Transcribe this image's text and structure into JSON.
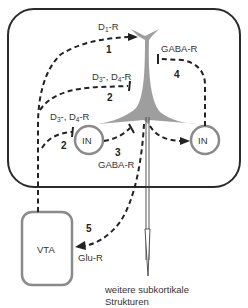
{
  "diagram": {
    "type": "neural-circuit",
    "regions": {
      "cortex_box": {
        "label": ""
      },
      "vta": {
        "label": "VTA"
      },
      "interneuron_left": {
        "label": "IN"
      },
      "interneuron_right": {
        "label": "IN"
      }
    },
    "pathways": [
      {
        "id": "1",
        "number": "1",
        "receptor": "D1-R",
        "receptor_main": "D",
        "receptor_sub": "1",
        "receptor_suffix": "-R",
        "type": "excitatory-arrow"
      },
      {
        "id": "2a",
        "number": "2",
        "receptor": "D3-, D4-R",
        "type": "inhibitory"
      },
      {
        "id": "2b",
        "number": "2",
        "receptor": "D3-, D4-R",
        "type": "inhibitory"
      },
      {
        "id": "3",
        "number": "3",
        "receptor": "GABA-R",
        "type": "inhibitory"
      },
      {
        "id": "4",
        "number": "4",
        "receptor": "GABA-R",
        "type": "inhibitory"
      },
      {
        "id": "5",
        "number": "5",
        "receptor": "Glu-R",
        "type": "excitatory-arrow"
      }
    ],
    "labels": {
      "d1": "D",
      "d1_sub": "1",
      "d1_suffix": "-R",
      "d3": "D",
      "d3_sub": "3",
      "d3_mid": "-, D",
      "d4_sub": "4",
      "d4_suffix": "-R",
      "gaba_r": "GABA-R",
      "glu_r": "Glu-R",
      "num1": "1",
      "num2": "2",
      "num3": "3",
      "num4": "4",
      "num5": "5",
      "output_line1": "weitere subkortikale",
      "output_line2": "Strukturen"
    },
    "colors": {
      "outline": "#2a2a2a",
      "neuron_fill": "#9e9e9e",
      "in_circle": "#8a8a8a",
      "vta_outline": "#8a8a8a",
      "dashed": "#222222"
    }
  }
}
